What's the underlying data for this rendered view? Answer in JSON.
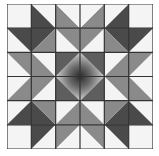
{
  "block": {
    "name": "quilt-star-block",
    "grid_size": 6,
    "colors": {
      "white": "#f4f4f4",
      "light": "#a6a6a6",
      "medium": "#8a8a8a",
      "dark": "#4a4a4a",
      "center_dark": "#5e5e5e",
      "center_light": "#d0d0d0",
      "center_core": "#2a2a2a",
      "line": "#333333"
    },
    "quadrant": [
      [
        {
          "type": "solid",
          "a": "white"
        },
        {
          "type": "bs",
          "ll": "dark",
          "ur": "white"
        },
        {
          "type": "bs",
          "ll": "medium",
          "ur": "white"
        }
      ],
      [
        {
          "type": "bs",
          "ll": "white",
          "ur": "dark"
        },
        {
          "type": "fs",
          "ul": "dark",
          "lr": "medium"
        },
        {
          "type": "bs",
          "ll": "white",
          "ur": "medium"
        }
      ],
      [
        {
          "type": "bs",
          "ll": "white",
          "ur": "medium"
        },
        {
          "type": "bs",
          "ll": "medium",
          "ur": "white"
        },
        {
          "type": "center"
        }
      ]
    ]
  }
}
